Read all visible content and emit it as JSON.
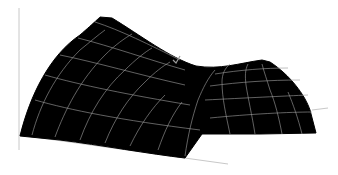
{
  "chart_data": {
    "type": "surface",
    "title": "",
    "xlabel": "",
    "ylabel": "",
    "zlabel": "",
    "colors": {
      "surface": "#000000",
      "grid": "#9a9a9a",
      "axis": "#c8c8c8",
      "background": "#ffffff"
    },
    "grid": false,
    "ticks": false,
    "legend": null,
    "axes_lines": [
      {
        "name": "z-axis",
        "x1": 19,
        "y1": 8,
        "x2": 19,
        "y2": 150
      },
      {
        "name": "x-axis-front",
        "x1": 19,
        "y1": 135,
        "x2": 228,
        "y2": 164
      },
      {
        "name": "y-axis-right",
        "x1": 312,
        "y1": 110,
        "x2": 328,
        "y2": 108
      }
    ],
    "outline": "M20,136 C30,95 50,55 80,35 C95,22 100,17 100,17 L112,18 C140,35 170,58 196,66 C220,70 240,63 262,60 L270,62 C290,75 305,95 310,110 L316,133 L260,134 L202,134 L185,158 C150,154 100,145 60,140 Z",
    "grid_lines": [
      "M35,100 C70,110 120,120 200,130",
      "M45,75 C80,85 130,95 190,105",
      "M60,55 C95,62 140,75 185,85",
      "M78,38 C110,46 150,60 185,70",
      "M95,22 C120,30 150,45 180,60",
      "M210,118 C250,114 290,112 312,112",
      "M205,100 C245,98 285,96 308,95",
      "M210,86 C240,82 270,80 300,80",
      "M215,74 C240,70 265,68 288,68",
      "M32,135 C40,105 55,75 80,50 C90,42 98,35 105,30",
      "M55,137 C65,110 80,80 105,55 C115,45 125,38 132,34",
      "M80,140 C90,112 105,88 125,70 C135,60 145,52 152,48",
      "M105,143 C115,118 128,98 145,82 C155,72 163,66 170,62",
      "M130,146 C140,125 152,108 165,95",
      "M158,150 C165,130 172,115 182,102",
      "M185,156 C188,135 192,118 198,100 C203,88 208,78 215,70",
      "M230,134 C226,115 222,98 222,82 C222,74 225,68 230,64",
      "M255,134 C252,115 248,98 246,85 C245,76 245,70 248,64",
      "M282,134 C279,118 275,102 270,90 C267,80 264,72 262,64",
      "M302,134 C298,118 293,104 288,92"
    ],
    "annotation_mark": {
      "name": "checkmark",
      "points": "173,60 176,63 180,56"
    }
  }
}
